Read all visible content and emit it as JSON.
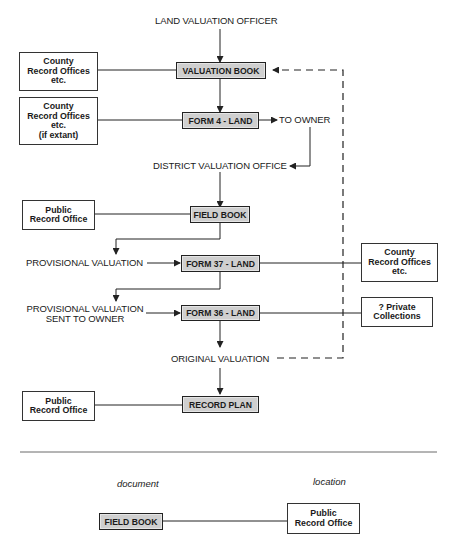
{
  "diagram": {
    "top_label": "LAND VALUATION OFFICER",
    "documents": {
      "valuation_book": "VALUATION BOOK",
      "form4": "FORM 4 - LAND",
      "field_book": "FIELD BOOK",
      "form37": "FORM 37 - LAND",
      "form36": "FORM 36 - LAND",
      "record_plan": "RECORD PLAN"
    },
    "labels": {
      "to_owner": "TO OWNER",
      "district_office": "DISTRICT VALUATION OFFICE",
      "provisional": "PROVISIONAL VALUATION",
      "provisional_sent_1": "PROVISIONAL VALUATION",
      "provisional_sent_2": "SENT TO OWNER",
      "original": "ORIGINAL VALUATION"
    },
    "locations": {
      "county1": [
        "County",
        "Record Offices",
        "etc."
      ],
      "county2": [
        "County",
        "Record Offices",
        "etc.",
        "(if extant)"
      ],
      "pro1": [
        "Public",
        "Record Office"
      ],
      "county3": [
        "County",
        "Record Offices",
        "etc."
      ],
      "private": [
        "? Private",
        "Collections"
      ],
      "pro2": [
        "Public",
        "Record Office"
      ]
    }
  },
  "legend": {
    "document_heading": "document",
    "location_heading": "location",
    "document_example": "FIELD BOOK",
    "location_example": [
      "Public",
      "Record Office"
    ]
  }
}
